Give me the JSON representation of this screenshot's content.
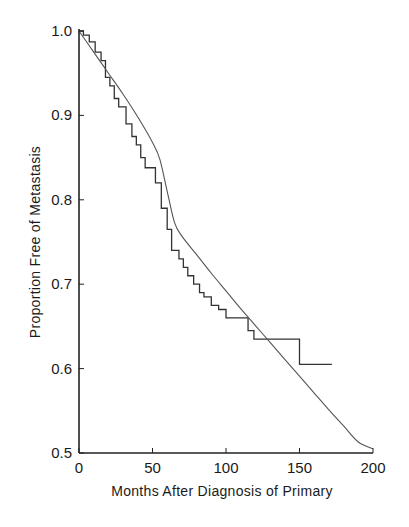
{
  "chart_data": {
    "type": "line",
    "title": "",
    "xlabel": "Months After Diagnosis of Primary",
    "ylabel": "Proportion Free of Metastasis",
    "xlim": [
      0,
      200
    ],
    "ylim": [
      0.5,
      1.0
    ],
    "xticks": [
      0,
      50,
      100,
      150,
      200
    ],
    "xtick_labels": [
      "0",
      "50",
      "100",
      "150",
      "200"
    ],
    "yticks": [
      0.5,
      0.6,
      0.7,
      0.8,
      0.9,
      1.0
    ],
    "ytick_labels": [
      "0.5",
      "0.6",
      "0.7",
      "0.8",
      "0.9",
      "1.0"
    ],
    "grid": false,
    "legend": null,
    "series": [
      {
        "name": "Kaplan-Meier estimate (observed)",
        "style": "step",
        "x": [
          0,
          3,
          3,
          7,
          7,
          11,
          11,
          15,
          15,
          18,
          18,
          21,
          21,
          24,
          24,
          27,
          27,
          32,
          32,
          36,
          36,
          39,
          39,
          42,
          42,
          45,
          45,
          52,
          52,
          56,
          56,
          60,
          60,
          63,
          63,
          68,
          68,
          71,
          71,
          74,
          74,
          78,
          78,
          82,
          82,
          85,
          85,
          90,
          90,
          95,
          95,
          100,
          100,
          108,
          108,
          115,
          115,
          119,
          119,
          150,
          150,
          172
        ],
        "y": [
          1.0,
          1.0,
          0.995,
          0.995,
          0.987,
          0.987,
          0.975,
          0.975,
          0.965,
          0.965,
          0.945,
          0.945,
          0.935,
          0.935,
          0.92,
          0.92,
          0.91,
          0.91,
          0.89,
          0.89,
          0.875,
          0.875,
          0.865,
          0.865,
          0.85,
          0.85,
          0.838,
          0.838,
          0.82,
          0.82,
          0.79,
          0.79,
          0.765,
          0.765,
          0.74,
          0.74,
          0.73,
          0.73,
          0.72,
          0.72,
          0.71,
          0.71,
          0.7,
          0.7,
          0.69,
          0.69,
          0.685,
          0.685,
          0.675,
          0.675,
          0.67,
          0.67,
          0.66,
          0.66,
          0.66,
          0.66,
          0.645,
          0.645,
          0.635,
          0.635,
          0.605,
          0.605
        ]
      },
      {
        "name": "Fitted model curve",
        "style": "smooth",
        "x": [
          0,
          10,
          20,
          30,
          40,
          50,
          55,
          60,
          65,
          70,
          80,
          90,
          100,
          110,
          120,
          130,
          140,
          150,
          160,
          170,
          180,
          190,
          200
        ],
        "y": [
          1.0,
          0.975,
          0.95,
          0.925,
          0.898,
          0.868,
          0.848,
          0.81,
          0.773,
          0.757,
          0.735,
          0.713,
          0.692,
          0.671,
          0.651,
          0.631,
          0.611,
          0.591,
          0.571,
          0.551,
          0.532,
          0.513,
          0.505
        ]
      }
    ]
  }
}
